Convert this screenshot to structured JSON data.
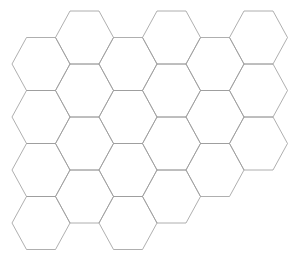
{
  "canvas": {
    "width": 301,
    "height": 258,
    "background_color": "#ffffff",
    "title": "Hexagonal Grid"
  },
  "grid": {
    "kind": "hexagonal-tiling",
    "orientation": "flat-top",
    "stroke_color": "#9a9a9a",
    "stroke_width": 0.8,
    "fill_color": "none",
    "hex_width": 58,
    "hex_height": 53,
    "circumradius": 29,
    "inradius": 26.5,
    "horizontal_period": 43.5,
    "vertical_period": 53,
    "column_vertical_offset": 26.5,
    "columns": 7,
    "rows": 5,
    "origin_x": 12,
    "origin_y": 11,
    "extent_x": 275,
    "extent_y": 242,
    "centers": [
      {
        "name": "c0-r0",
        "cx": 41,
        "cy": 64
      },
      {
        "name": "c0-r1",
        "cx": 41,
        "cy": 117
      },
      {
        "name": "c0-r2",
        "cx": 41,
        "cy": 170
      },
      {
        "name": "c0-r3",
        "cx": 41,
        "cy": 223
      },
      {
        "name": "c1-r0",
        "cx": 84.5,
        "cy": 37.5
      },
      {
        "name": "c1-r1",
        "cx": 84.5,
        "cy": 90.5
      },
      {
        "name": "c1-r2",
        "cx": 84.5,
        "cy": 143.5
      },
      {
        "name": "c1-r3",
        "cx": 84.5,
        "cy": 196.5
      },
      {
        "name": "c2-r0",
        "cx": 128,
        "cy": 64
      },
      {
        "name": "c2-r1",
        "cx": 128,
        "cy": 117
      },
      {
        "name": "c2-r2",
        "cx": 128,
        "cy": 170
      },
      {
        "name": "c2-r3",
        "cx": 128,
        "cy": 223
      },
      {
        "name": "c3-r0",
        "cx": 171.5,
        "cy": 37.5
      },
      {
        "name": "c3-r1",
        "cx": 171.5,
        "cy": 90.5
      },
      {
        "name": "c3-r2",
        "cx": 171.5,
        "cy": 143.5
      },
      {
        "name": "c3-r3",
        "cx": 171.5,
        "cy": 196.5
      },
      {
        "name": "c4-r0",
        "cx": 215,
        "cy": 64
      },
      {
        "name": "c4-r1",
        "cx": 215,
        "cy": 117
      },
      {
        "name": "c4-r2",
        "cx": 215,
        "cy": 170
      },
      {
        "name": "c5-r0",
        "cx": 258.5,
        "cy": 37.5
      },
      {
        "name": "c5-r1",
        "cx": 258.5,
        "cy": 90.5
      },
      {
        "name": "c5-r2",
        "cx": 258.5,
        "cy": 143.5
      }
    ]
  }
}
